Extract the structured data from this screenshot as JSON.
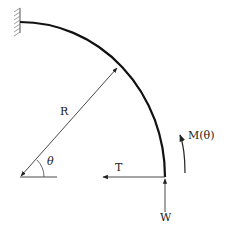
{
  "diagram": {
    "type": "curved cantilever beam free-body diagram",
    "colors": {
      "beam": "#111111",
      "lines": "#333333",
      "hatch": "#777777",
      "background": "#ffffff"
    },
    "labels": {
      "radius": "R",
      "angle": "θ",
      "tension": "T",
      "weight": "W",
      "moment": "M(θ)"
    },
    "elements": [
      {
        "id": "fixed-support",
        "kind": "hatched wall",
        "position": "top-left"
      },
      {
        "id": "beam",
        "kind": "quarter-circle arc",
        "from": "fixed support",
        "to": "free end (bottom right)"
      },
      {
        "id": "radius-arrow",
        "kind": "double-headed arrow",
        "label": "R"
      },
      {
        "id": "angle-mark",
        "kind": "arc",
        "label": "θ"
      },
      {
        "id": "tension-force",
        "kind": "arrow pointing left",
        "label": "T"
      },
      {
        "id": "weight-force",
        "kind": "arrow pointing up",
        "label": "W"
      },
      {
        "id": "moment",
        "kind": "curved arrow",
        "label": "M(θ)"
      }
    ]
  }
}
